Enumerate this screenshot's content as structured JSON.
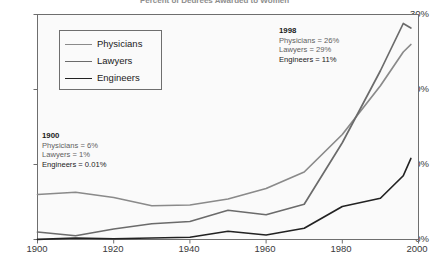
{
  "chart_data": {
    "type": "line",
    "title": "Percent of Degrees Awarded to Women",
    "xlabel": "",
    "ylabel": "",
    "xlim": [
      1900,
      2000
    ],
    "ylim": [
      0,
      30
    ],
    "xticks": [
      "1900",
      "1920",
      "1940",
      "1960",
      "1980",
      "2000"
    ],
    "yticks": [
      "0%",
      "10%",
      "20%",
      "30%"
    ],
    "grid": false,
    "legend_position": "upper-left-inside",
    "x": [
      1900,
      1910,
      1920,
      1930,
      1940,
      1950,
      1960,
      1970,
      1980,
      1990,
      1996,
      1998
    ],
    "series": [
      {
        "name": "Physicians",
        "color": "#8a8a8a",
        "values": [
          6.0,
          6.3,
          5.6,
          4.5,
          4.6,
          5.4,
          6.8,
          9.0,
          14.0,
          20.5,
          25.0,
          26.0
        ]
      },
      {
        "name": "Lawyers",
        "color": "#6b6b6b",
        "values": [
          1.0,
          0.5,
          1.4,
          2.1,
          2.4,
          3.9,
          3.3,
          4.7,
          12.9,
          22.5,
          28.8,
          28.2
        ]
      },
      {
        "name": "Engineers",
        "color": "#222222",
        "values": [
          0.01,
          0.2,
          0.1,
          0.2,
          0.3,
          1.1,
          0.6,
          1.5,
          4.4,
          5.5,
          8.5,
          10.8
        ]
      }
    ],
    "annotations": [
      {
        "id": "annot-1900",
        "year": "1900",
        "lines": [
          "Physicians = 6%",
          "Lawyers = 1%",
          "Engineers = 0.01%"
        ]
      },
      {
        "id": "annot-1998",
        "year": "1998",
        "lines": [
          "Physicians = 26%",
          "Lawyers = 29%",
          "Engineers = 11%"
        ]
      }
    ]
  },
  "legend": {
    "items": [
      {
        "label": "Physicians",
        "color": "#8a8a8a"
      },
      {
        "label": "Lawyers",
        "color": "#6b6b6b"
      },
      {
        "label": "Engineers",
        "color": "#222222"
      }
    ]
  },
  "axis": {
    "y": [
      "30%",
      "20%",
      "10%",
      "0%"
    ],
    "x": [
      "1900",
      "1920",
      "1940",
      "1960",
      "1980",
      "2000"
    ]
  },
  "colors": {
    "plot_background": "#fafafa",
    "axis": "#6e6e6e",
    "text": "#3a3a3a"
  }
}
